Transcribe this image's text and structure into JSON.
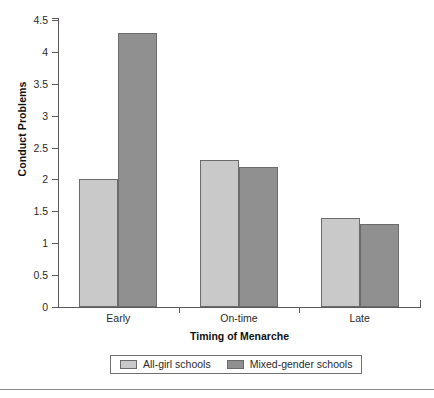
{
  "chart_data": {
    "type": "bar",
    "title": "",
    "subtitle": "",
    "xlabel": "Timing of Menarche",
    "ylabel": "Conduct Problems",
    "categories": [
      "Early",
      "On-time",
      "Late"
    ],
    "series": [
      {
        "name": "All-girl schools",
        "values": [
          2.0,
          2.3,
          1.4
        ],
        "color": "#c9c9c9"
      },
      {
        "name": "Mixed-gender schools",
        "values": [
          4.3,
          2.2,
          1.3
        ],
        "color": "#909090"
      }
    ],
    "ylim": [
      0,
      4.5
    ],
    "ytick_step": 0.5,
    "ytick_labels": [
      "4.5",
      "4",
      "3.5",
      "3",
      "2.5",
      "2",
      "1.5",
      "1",
      "0.5",
      "0"
    ],
    "ytick_values": [
      4.5,
      4,
      3.5,
      3,
      2.5,
      2,
      1.5,
      1,
      0.5,
      0
    ],
    "grid": false,
    "legend_position": "bottom"
  },
  "axes": {
    "y_title": "Conduct Problems",
    "x_title": "Timing of Menarche"
  },
  "legend": {
    "entries": [
      {
        "label": "All-girl schools"
      },
      {
        "label": "Mixed-gender schools"
      }
    ]
  }
}
